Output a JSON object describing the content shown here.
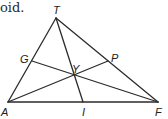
{
  "caption_fragment": "oid.",
  "diagram": {
    "type": "triangle-medians-centroid",
    "stroke_color": "#2b2b2b",
    "vertices": {
      "T": {
        "label": "T",
        "x": 56,
        "y": 18,
        "label_x": 53,
        "label_y": 14
      },
      "A": {
        "label": "A",
        "x": 8,
        "y": 102,
        "label_x": 1,
        "label_y": 116
      },
      "F": {
        "label": "F",
        "x": 158,
        "y": 102,
        "label_x": 157,
        "label_y": 116
      }
    },
    "points": {
      "G": {
        "label": "G",
        "x": 32,
        "y": 61,
        "label_x": 20,
        "label_y": 63
      },
      "P": {
        "label": "P",
        "x": 108,
        "y": 61,
        "label_x": 112,
        "label_y": 61
      },
      "I": {
        "label": "I",
        "x": 83,
        "y": 102,
        "label_x": 82,
        "label_y": 116
      },
      "Y": {
        "label": "Y",
        "x": 73,
        "y": 75,
        "label_x": 74,
        "label_y": 73
      }
    },
    "segments": [
      [
        "T",
        "A"
      ],
      [
        "T",
        "F"
      ],
      [
        "A",
        "F"
      ],
      [
        "T",
        "I"
      ],
      [
        "G",
        "F"
      ],
      [
        "A",
        "P"
      ]
    ]
  }
}
